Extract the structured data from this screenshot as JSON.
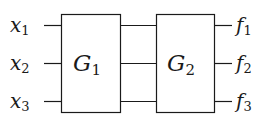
{
  "diagram": {
    "inputs": [
      {
        "var": "x",
        "sub": "1"
      },
      {
        "var": "x",
        "sub": "2"
      },
      {
        "var": "x",
        "sub": "3"
      }
    ],
    "blocks": [
      {
        "name": "G",
        "sub": "1"
      },
      {
        "name": "G",
        "sub": "2"
      }
    ],
    "outputs": [
      {
        "var": "f",
        "sub": "1"
      },
      {
        "var": "f",
        "sub": "2"
      },
      {
        "var": "f",
        "sub": "3"
      }
    ],
    "colors": {
      "stroke": "#1a1a1a",
      "background": "#ffffff"
    }
  }
}
